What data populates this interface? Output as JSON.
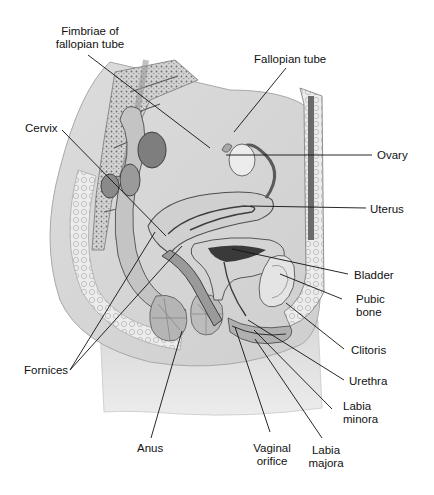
{
  "figure": {
    "type": "anatomical-illustration",
    "style": "grayscale pencil illustration with leader-line callouts"
  },
  "labels": {
    "fimbriae": {
      "line1": "Fimbriae of",
      "line2": "fallopian tube"
    },
    "fallopian_tube": "Fallopian tube",
    "cervix": "Cervix",
    "ovary": "Ovary",
    "uterus": "Uterus",
    "bladder": "Bladder",
    "pubic_bone": {
      "line1": "Pubic",
      "line2": "bone"
    },
    "clitoris": "Clitoris",
    "fornices": "Fornices",
    "urethra": "Urethra",
    "labia_minora": {
      "line1": "Labia",
      "line2": "minora"
    },
    "anus": "Anus",
    "vaginal_orifice": {
      "line1": "Vaginal",
      "line2": "orifice"
    },
    "labia_majora": {
      "line1": "Labia",
      "line2": "majora"
    }
  },
  "colors": {
    "background": "#ffffff",
    "text": "#111111",
    "leader_line": "#111111",
    "tissue_light": "#e6e6e6",
    "tissue_mid": "#bdbdbd",
    "tissue_dark": "#7a7a7a"
  }
}
